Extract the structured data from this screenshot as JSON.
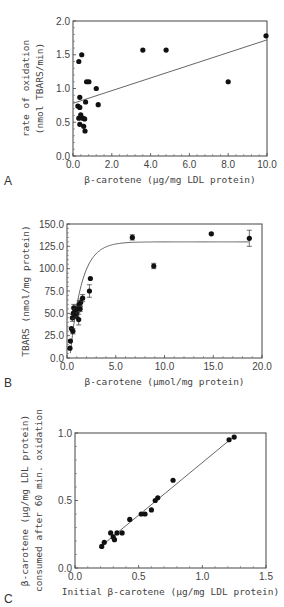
{
  "chart_data": [
    {
      "panel": "A",
      "type": "scatter",
      "title": "",
      "xlabel": "β-carotene (µg/mg LDL protein)",
      "ylabel_line1": "rate of oxidation",
      "ylabel_line2": "(nmol TBARS/min)",
      "xlim": [
        0,
        10
      ],
      "ylim": [
        0,
        2.0
      ],
      "xticks": [
        "0.0",
        "2.0",
        "4.0",
        "6.0",
        "8.0",
        "10.0"
      ],
      "yticks": [
        "0.0",
        "0.5",
        "1.0",
        "1.5",
        "2.0"
      ],
      "grid": false,
      "points": [
        [
          0.3,
          1.4
        ],
        [
          0.45,
          1.5
        ],
        [
          0.25,
          0.74
        ],
        [
          0.35,
          0.72
        ],
        [
          0.35,
          0.87
        ],
        [
          0.3,
          0.56
        ],
        [
          0.35,
          0.47
        ],
        [
          0.4,
          0.61
        ],
        [
          0.5,
          0.56
        ],
        [
          0.55,
          0.44
        ],
        [
          0.6,
          0.55
        ],
        [
          0.62,
          0.37
        ],
        [
          0.65,
          0.8
        ],
        [
          0.7,
          1.1
        ],
        [
          0.82,
          1.1
        ],
        [
          1.2,
          1.0
        ],
        [
          1.3,
          0.76
        ],
        [
          3.6,
          1.57
        ],
        [
          4.8,
          1.57
        ],
        [
          8.0,
          1.1
        ],
        [
          9.95,
          1.78
        ]
      ],
      "fit_line": [
        [
          0,
          0.78
        ],
        [
          10,
          1.72
        ]
      ]
    },
    {
      "panel": "B",
      "type": "scatter",
      "title": "",
      "xlabel": "β-carotene (µmol/mg protein)",
      "ylabel": "TBARS (nmol/mg protein)",
      "xlim": [
        0,
        20
      ],
      "ylim": [
        0,
        150
      ],
      "xticks": [
        "0.0",
        "5.0",
        "10.0",
        "15.0",
        "20.0"
      ],
      "yticks": [
        "0.0",
        "25.0",
        "50.0",
        "75.0",
        "100.0",
        "125.0",
        "150.0"
      ],
      "grid": false,
      "points": [
        [
          0.3,
          11,
          0
        ],
        [
          0.35,
          19,
          0
        ],
        [
          0.45,
          33,
          0
        ],
        [
          0.6,
          30,
          3
        ],
        [
          0.55,
          45,
          4
        ],
        [
          0.65,
          50,
          6
        ],
        [
          0.7,
          56,
          4
        ],
        [
          0.8,
          52,
          3
        ],
        [
          0.9,
          47,
          3
        ],
        [
          1.0,
          50,
          4
        ],
        [
          1.1,
          55,
          4
        ],
        [
          1.2,
          43,
          6
        ],
        [
          1.25,
          60,
          4
        ],
        [
          1.35,
          55,
          3
        ],
        [
          1.4,
          62,
          4
        ],
        [
          1.6,
          67,
          4
        ],
        [
          2.3,
          75,
          7
        ],
        [
          2.4,
          89,
          0
        ],
        [
          6.7,
          135,
          3
        ],
        [
          8.9,
          103,
          3
        ],
        [
          14.8,
          139,
          1
        ],
        [
          18.7,
          134,
          9
        ]
      ],
      "fit_curve": {
        "plateau": 130,
        "rate": 0.85
      }
    },
    {
      "panel": "C",
      "type": "scatter",
      "title": "",
      "xlabel": "Initial β-carotene (µg/mg LDL protein)",
      "ylabel_line1": "β-carotene (µg/mg LDL protein)",
      "ylabel_line2": "consumed after 60 min. oxidation",
      "xlim": [
        0,
        1.5
      ],
      "ylim": [
        0,
        1.0
      ],
      "xticks": [
        "0.0",
        "0.5",
        "1.0",
        "1.5"
      ],
      "yticks": [
        "0.0",
        "0.5",
        "1.0"
      ],
      "grid": false,
      "points": [
        [
          0.21,
          0.16
        ],
        [
          0.23,
          0.19
        ],
        [
          0.28,
          0.26
        ],
        [
          0.3,
          0.23
        ],
        [
          0.31,
          0.21
        ],
        [
          0.33,
          0.26
        ],
        [
          0.37,
          0.26
        ],
        [
          0.43,
          0.36
        ],
        [
          0.52,
          0.4
        ],
        [
          0.55,
          0.4
        ],
        [
          0.6,
          0.43
        ],
        [
          0.63,
          0.5
        ],
        [
          0.65,
          0.52
        ],
        [
          0.77,
          0.65
        ],
        [
          1.21,
          0.95
        ],
        [
          1.25,
          0.97
        ]
      ],
      "fit_line": [
        [
          0.19,
          0.15
        ],
        [
          1.23,
          0.96
        ]
      ]
    }
  ],
  "panel_labels": [
    "A",
    "B",
    "C"
  ]
}
